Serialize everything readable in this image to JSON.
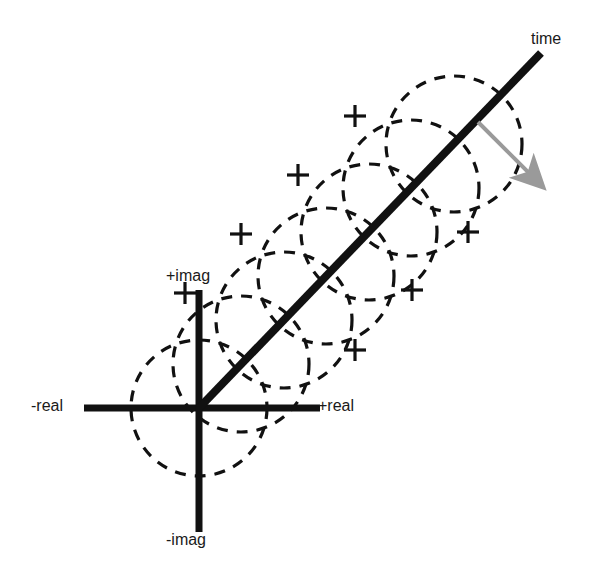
{
  "figure": {
    "type": "diagram",
    "background_color": "#ffffff",
    "axis_color": "#111111",
    "circle_color": "#111111",
    "arrow_color": "#9a9a9a"
  },
  "labels": {
    "time": "time",
    "plus_imag": "+imag",
    "minus_imag": "-imag",
    "plus_real": "+real",
    "minus_real": "-real"
  },
  "label_positions": {
    "time": {
      "x": 531,
      "y": 31
    },
    "plus_imag": {
      "x": 166,
      "y": 268
    },
    "minus_imag": {
      "x": 166,
      "y": 532
    },
    "plus_real": {
      "x": 318,
      "y": 398
    },
    "minus_real": {
      "x": 31,
      "y": 398
    }
  },
  "geometry": {
    "origin": {
      "x": 199,
      "y": 408
    },
    "real_axis": {
      "x1": 84,
      "y1": 408,
      "x2": 320,
      "y2": 408,
      "width": 7
    },
    "imag_axis": {
      "x1": 199,
      "y1": 290,
      "x2": 199,
      "y2": 532,
      "width": 7
    },
    "time_axis": {
      "x1": 199,
      "y1": 408,
      "x2": 541,
      "y2": 53,
      "width": 8
    },
    "circle_radius": 68,
    "dash_pattern": "11 9",
    "circle_stroke_width": 3.2,
    "cross_arm": 11,
    "cross_stroke_width": 3.2,
    "phasor_arrow": {
      "x1": 478,
      "y1": 122,
      "x2": 541,
      "y2": 185,
      "width": 4,
      "head_length": 22,
      "head_width": 16
    }
  },
  "chart_data": {
    "type": "scatter",
    "circle_radius": 68,
    "centers": [
      {
        "x": 199,
        "y": 408
      },
      {
        "x": 241,
        "y": 364
      },
      {
        "x": 284,
        "y": 320
      },
      {
        "x": 326,
        "y": 276
      },
      {
        "x": 369,
        "y": 232
      },
      {
        "x": 411,
        "y": 188
      },
      {
        "x": 454,
        "y": 144
      }
    ],
    "crosshair_markers": [
      {
        "x": 185,
        "y": 293
      },
      {
        "x": 241,
        "y": 234
      },
      {
        "x": 298,
        "y": 175
      },
      {
        "x": 355,
        "y": 116
      },
      {
        "x": 355,
        "y": 350
      },
      {
        "x": 412,
        "y": 290
      },
      {
        "x": 468,
        "y": 232
      }
    ],
    "xlabel": "real",
    "ylabel": "imag",
    "zlabel": "time"
  }
}
